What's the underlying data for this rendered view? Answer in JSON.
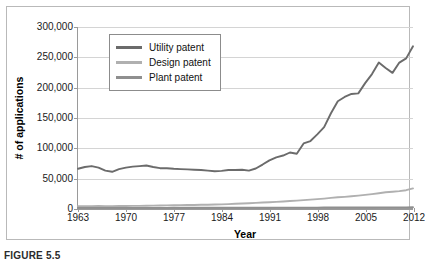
{
  "caption": "FIGURE 5.5",
  "chart_data": {
    "type": "line",
    "title": "",
    "xlabel": "Year",
    "ylabel": "# of applications",
    "xlim": [
      1963,
      2012
    ],
    "ylim": [
      0,
      300000
    ],
    "grid": true,
    "legend_position": "top-left-inside",
    "ytick_labels": [
      "300,000",
      "250,000",
      "200,000",
      "150,000",
      "100,000",
      "50,000",
      "0"
    ],
    "ytick_values": [
      300000,
      250000,
      200000,
      150000,
      100000,
      50000,
      0
    ],
    "xtick_labels": [
      "1963",
      "1970",
      "1977",
      "1984",
      "1991",
      "1998",
      "2005",
      "2012"
    ],
    "xtick_values": [
      1963,
      1970,
      1977,
      1984,
      1991,
      1998,
      2005,
      2012
    ],
    "x": [
      1963,
      1964,
      1965,
      1966,
      1967,
      1968,
      1969,
      1970,
      1971,
      1972,
      1973,
      1974,
      1975,
      1976,
      1977,
      1978,
      1979,
      1980,
      1981,
      1982,
      1983,
      1984,
      1985,
      1986,
      1987,
      1988,
      1989,
      1990,
      1991,
      1992,
      1993,
      1994,
      1995,
      1996,
      1997,
      1998,
      1999,
      2000,
      2001,
      2002,
      2003,
      2004,
      2005,
      2006,
      2007,
      2008,
      2009,
      2010,
      2011,
      2012
    ],
    "series": [
      {
        "name": "Utility patent",
        "color": "#6b6b6b",
        "values": [
          65000,
          68000,
          69500,
          67000,
          62000,
          60000,
          64500,
          67000,
          68500,
          69500,
          70500,
          68000,
          66000,
          66000,
          65000,
          64500,
          64000,
          63500,
          63000,
          62000,
          61000,
          61500,
          63000,
          63000,
          63500,
          62000,
          65500,
          72000,
          79000,
          84000,
          87000,
          92000,
          90000,
          107000,
          111000,
          122000,
          134000,
          157000,
          177000,
          184000,
          189000,
          190000,
          207000,
          222000,
          241000,
          232000,
          224000,
          241000,
          248000,
          268000
        ],
        "label_note": "Rises sharply from mid-1980s; 1996 spike then 1997 dip; 2006 peak, 2008-2009 dip, then record high in 2012"
      },
      {
        "name": "Design patent",
        "color": "#b0b0b0",
        "values": [
          2900,
          3000,
          3100,
          3200,
          3100,
          3000,
          3200,
          3300,
          3500,
          3600,
          3800,
          4000,
          4200,
          4300,
          4500,
          4700,
          4900,
          5100,
          5300,
          5500,
          5700,
          6000,
          6500,
          7000,
          7500,
          8000,
          8500,
          9000,
          9600,
          10200,
          10800,
          11500,
          12200,
          13000,
          13800,
          14700,
          15600,
          16700,
          17700,
          18500,
          19400,
          20500,
          21700,
          23000,
          24500,
          26000,
          27000,
          28000,
          29500,
          32500
        ]
      },
      {
        "name": "Plant patent",
        "color": "#8f8f8f",
        "values": [
          150,
          160,
          170,
          180,
          190,
          200,
          210,
          220,
          230,
          240,
          250,
          260,
          270,
          280,
          290,
          300,
          310,
          320,
          330,
          340,
          360,
          380,
          400,
          420,
          440,
          460,
          480,
          500,
          520,
          540,
          560,
          580,
          600,
          630,
          660,
          690,
          720,
          750,
          780,
          810,
          840,
          870,
          900,
          930,
          960,
          990,
          1020,
          1050,
          1080,
          1140
        ]
      }
    ]
  }
}
